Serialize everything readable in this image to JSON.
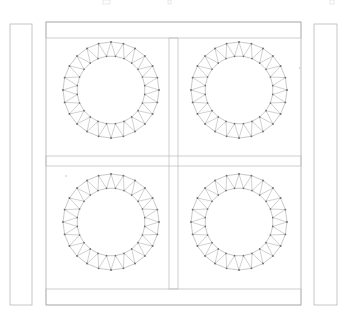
{
  "drawing": {
    "title": "Structural Frame Elevation",
    "type": "cad-elevation",
    "canvas": {
      "width": 347,
      "height": 318
    },
    "background_color": "#ffffff",
    "line_color": "#b3b3b3",
    "truss_line_color": "#9a9a9a",
    "node_color": "#6e6e6e",
    "tick_color": "#d8d8d8"
  },
  "columns": [
    {
      "name": "left-column",
      "label": "Left Column",
      "x": 10,
      "y": 24,
      "width": 22,
      "height": 281
    },
    {
      "name": "right-column",
      "label": "Right Column",
      "x": 314,
      "y": 24,
      "width": 23,
      "height": 281
    }
  ],
  "main_frame": {
    "name": "main-frame",
    "label": "Main Frame",
    "x": 46,
    "y": 22,
    "width": 255,
    "height": 283,
    "bands": [
      {
        "name": "top-beam-band",
        "label": "Top Beam",
        "y": 22,
        "height": 16
      },
      {
        "name": "mid-beam-band",
        "label": "Mid Beam",
        "y": 156,
        "height": 10
      },
      {
        "name": "bottom-beam-band",
        "label": "Bottom Beam",
        "y": 289,
        "height": 16
      }
    ],
    "center_post": {
      "name": "center-post",
      "label": "Center Post",
      "x": 169,
      "width": 9,
      "y_top": 38,
      "y_bottom": 289
    }
  },
  "truss_rings": [
    {
      "name": "truss-ring-top-left",
      "label": "Ring 1 Top Left",
      "cx": 111,
      "cy": 90,
      "outer_radius": 48,
      "inner_radius": 34,
      "segments": 24
    },
    {
      "name": "truss-ring-top-right",
      "label": "Ring 2 Top Right",
      "cx": 239,
      "cy": 90,
      "outer_radius": 48,
      "inner_radius": 34,
      "segments": 24
    },
    {
      "name": "truss-ring-bottom-left",
      "label": "Ring 3 Bottom Left",
      "cx": 111,
      "cy": 222,
      "outer_radius": 48,
      "inner_radius": 34,
      "segments": 24
    },
    {
      "name": "truss-ring-bottom-right",
      "label": "Ring 4 Bottom Right",
      "cx": 239,
      "cy": 222,
      "outer_radius": 48,
      "inner_radius": 34,
      "segments": 24
    }
  ],
  "top_tick_marks": [
    {
      "name": "tick-mark-1",
      "x": 103,
      "y": 0,
      "width": 7,
      "height": 4
    },
    {
      "name": "tick-mark-2",
      "x": 168,
      "y": 0,
      "width": 3,
      "height": 4
    },
    {
      "name": "tick-mark-3",
      "x": 330,
      "y": 0,
      "width": 4,
      "height": 4
    }
  ],
  "faint_marks": [
    {
      "name": "faint-mark-right",
      "x": 300,
      "y": 68,
      "r": 1.2
    },
    {
      "name": "faint-mark-left",
      "x": 66,
      "y": 176,
      "r": 1.0
    }
  ]
}
